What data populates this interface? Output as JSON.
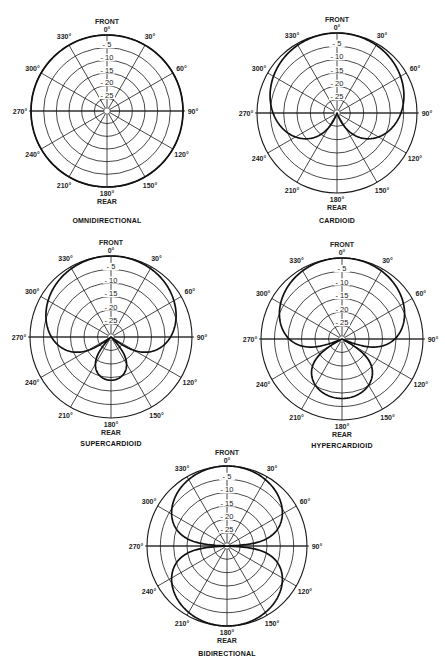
{
  "figure": {
    "background": "#ffffff",
    "line_color": "#1a1a1a",
    "pattern_color": "#111111"
  },
  "chart_data": [
    {
      "type": "polar",
      "id": "omni",
      "title": "OMNIDIRECTIONAL",
      "center": [
        107,
        111
      ],
      "radius": 76,
      "title_y": 223,
      "front_label": "FRONT",
      "rear_label": "REAR",
      "angle_labels": [
        "0°",
        "30°",
        "60°",
        "90°",
        "120°",
        "150°",
        "180°",
        "210°",
        "240°",
        "270°",
        "300°",
        "330°"
      ],
      "ring_labels": [
        "- 5",
        "- 10",
        "- 15",
        "- 20",
        "- 25"
      ],
      "ring_db": [
        0,
        -5,
        -10,
        -15,
        -20,
        -25
      ],
      "rlim_db": [
        -30,
        0
      ],
      "pattern_formula": "a + (1-a)cos(theta)",
      "a": 1.0
    },
    {
      "type": "polar",
      "id": "cardioid",
      "title": "CARDIOID",
      "center": [
        337,
        113
      ],
      "radius": 80,
      "title_y": 223,
      "front_label": "FRONT",
      "rear_label": "REAR",
      "angle_labels": [
        "0°",
        "30°",
        "60°",
        "90°",
        "120°",
        "150°",
        "180°",
        "210°",
        "240°",
        "270°",
        "300°",
        "330°"
      ],
      "ring_labels": [
        "- 5",
        "- 10",
        "- 15",
        "- 20",
        "- 25"
      ],
      "ring_db": [
        0,
        -5,
        -10,
        -15,
        -20,
        -25
      ],
      "rlim_db": [
        -30,
        0
      ],
      "pattern_formula": "a + (1-a)cos(theta)",
      "a": 0.5
    },
    {
      "type": "polar",
      "id": "supercardioid",
      "title": "SUPERCARDIOID",
      "center": [
        111,
        337
      ],
      "radius": 81,
      "title_y": 446,
      "front_label": "FRONT",
      "rear_label": "REAR",
      "angle_labels": [
        "0°",
        "30°",
        "60°",
        "90°",
        "120°",
        "150°",
        "180°",
        "210°",
        "240°",
        "270°",
        "300°",
        "330°"
      ],
      "ring_labels": [
        "- 5",
        "- 10",
        "- 15",
        "- 20",
        "- 25"
      ],
      "ring_db": [
        0,
        -5,
        -10,
        -15,
        -20,
        -25
      ],
      "rlim_db": [
        -30,
        0
      ],
      "pattern_formula": "a + (1-a)cos(theta)",
      "a": 0.4
    },
    {
      "type": "polar",
      "id": "hypercardioid",
      "title": "HYPERCARDIOID",
      "center": [
        342,
        339
      ],
      "radius": 81,
      "title_y": 448,
      "front_label": "FRONT",
      "rear_label": "REAR",
      "angle_labels": [
        "0°",
        "30°",
        "60°",
        "90°",
        "120°",
        "150°",
        "180°",
        "210°",
        "240°",
        "270°",
        "300°",
        "330°"
      ],
      "ring_labels": [
        "- 5",
        "- 10",
        "- 15",
        "- 20",
        "- 25"
      ],
      "ring_db": [
        0,
        -5,
        -10,
        -15,
        -20,
        -25
      ],
      "rlim_db": [
        -30,
        0
      ],
      "pattern_formula": "a + (1-a)cos(theta)",
      "a": 0.3
    },
    {
      "type": "polar",
      "id": "bidirectional",
      "title": "BIDIRECTIONAL",
      "center": [
        227,
        546
      ],
      "radius": 80,
      "title_y": 656,
      "front_label": "FRONT",
      "rear_label": "REAR",
      "angle_labels": [
        "0°",
        "30°",
        "60°",
        "90°",
        "120°",
        "150°",
        "180°",
        "210°",
        "240°",
        "270°",
        "300°",
        "330°"
      ],
      "ring_labels": [
        "- 5",
        "- 10",
        "- 15",
        "- 20",
        "- 25"
      ],
      "ring_db": [
        0,
        -5,
        -10,
        -15,
        -20,
        -25
      ],
      "rlim_db": [
        -30,
        0
      ],
      "pattern_formula": "a + (1-a)cos(theta)",
      "a": 0.0
    }
  ]
}
